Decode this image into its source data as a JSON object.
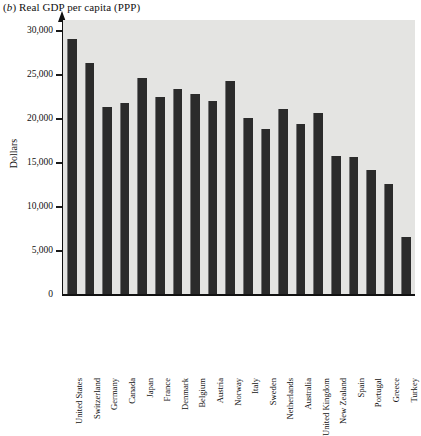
{
  "chart_data": {
    "type": "bar",
    "title_prefix_italic": "b",
    "xlabel": "",
    "ylabel": "Dollars",
    "ylim": [
      0,
      30000
    ],
    "ytick_values": [
      0,
      5000,
      10000,
      15000,
      20000,
      25000,
      30000
    ],
    "ytick_labels": [
      "0",
      "5,000",
      "10,000",
      "15,000",
      "20,000",
      "25,000",
      "30,000"
    ],
    "grid": false,
    "legend": null,
    "bar_color": "#2b2b2b",
    "plot_background": "#e4e4e2",
    "categories": [
      "United States",
      "Switzerland",
      "Germany",
      "Canada",
      "Japan",
      "France",
      "Denmark",
      "Belgium",
      "Austria",
      "Norway",
      "Italy",
      "Sweden",
      "Netherlands",
      "Australia",
      "United Kingdom",
      "New Zealand",
      "Spain",
      "Portugal",
      "Greece",
      "Turkey"
    ],
    "values": [
      29100,
      26400,
      21400,
      21800,
      24700,
      22500,
      23400,
      22800,
      22000,
      24300,
      20100,
      18900,
      21100,
      19400,
      20700,
      15800,
      15700,
      14200,
      12600,
      6600
    ]
  }
}
